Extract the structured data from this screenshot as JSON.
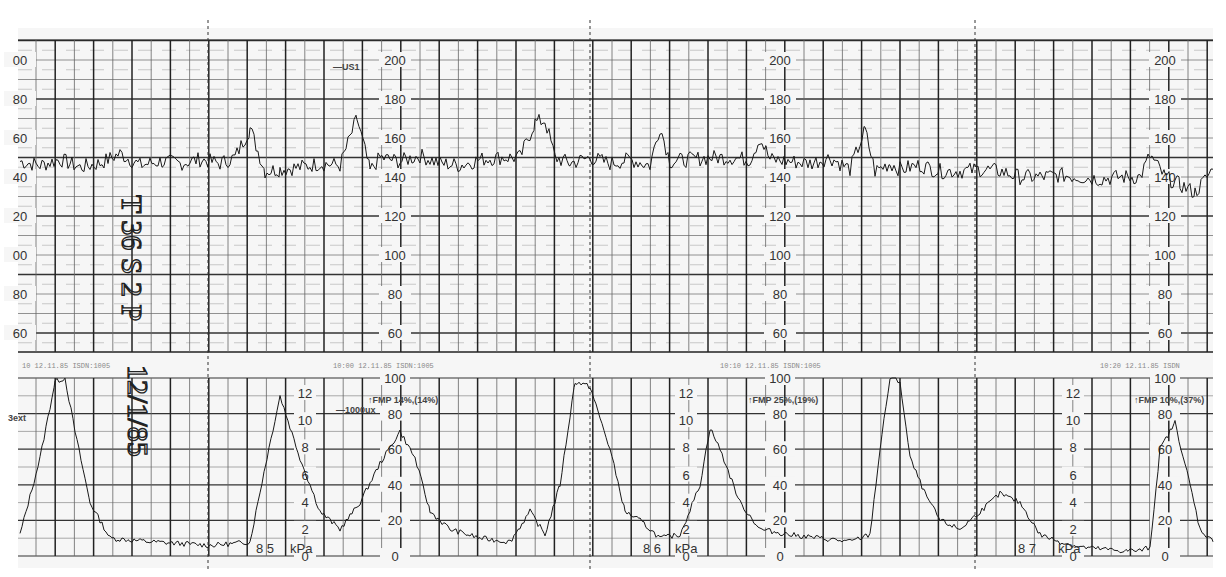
{
  "chart_data": {
    "type": "line",
    "panels": [
      {
        "name": "fetal_heart_rate",
        "ylabel": "bpm",
        "ylim": [
          50,
          210
        ],
        "yticks": [
          60,
          80,
          100,
          120,
          140,
          160,
          180,
          200
        ],
        "scale_label_x_positions": [
          20,
          395,
          780,
          1165
        ],
        "trace_label": "US1",
        "grid": true,
        "series": [
          {
            "name": "FHR",
            "baseline_bpm": 145,
            "x": [
              20,
              40,
              60,
              80,
              100,
              120,
              140,
              160,
              180,
              200,
              220,
              235,
              250,
              265,
              280,
              300,
              320,
              340,
              357,
              370,
              380,
              400,
              420,
              440,
              460,
              480,
              500,
              520,
              535,
              545,
              555,
              570,
              590,
              610,
              630,
              650,
              660,
              670,
              690,
              710,
              730,
              750,
              760,
              770,
              790,
              810,
              830,
              850,
              865,
              875,
              890,
              900,
              920,
              940,
              960,
              980,
              1000,
              1020,
              1040,
              1060,
              1080,
              1100,
              1120,
              1140,
              1150,
              1165,
              1180,
              1195,
              1213
            ],
            "values": [
              148,
              146,
              149,
              145,
              147,
              152,
              146,
              148,
              147,
              149,
              147,
              150,
              165,
              143,
              144,
              145,
              147,
              146,
              170,
              143,
              150,
              148,
              151,
              147,
              146,
              149,
              150,
              150,
              168,
              169,
              150,
              147,
              150,
              147,
              149,
              146,
              166,
              148,
              149,
              150,
              150,
              149,
              160,
              149,
              148,
              147,
              150,
              144,
              164,
              143,
              147,
              144,
              146,
              143,
              143,
              144,
              143,
              140,
              140,
              141,
              140,
              139,
              140,
              140,
              151,
              140,
              136,
              132,
              144
            ]
          },
          {
            "name": "FMP_markers_text",
            "values": []
          }
        ]
      },
      {
        "name": "uterine_activity",
        "ylabel_left": "kPa",
        "ylabel_right": "%",
        "ylim_percent": [
          0,
          100
        ],
        "ylim_kPa": [
          0,
          12
        ],
        "yticks_kPa": [
          0,
          2,
          4,
          6,
          8,
          10,
          12
        ],
        "yticks_percent": [
          0,
          20,
          40,
          60,
          80,
          100
        ],
        "grid": true,
        "series": [
          {
            "name": "UA (TOCO)",
            "x": [
              20,
              40,
              55,
              65,
              75,
              90,
              110,
              130,
              150,
              180,
              210,
              235,
              250,
              265,
              280,
              300,
              320,
              340,
              360,
              380,
              400,
              415,
              430,
              450,
              480,
              510,
              530,
              545,
              560,
              575,
              590,
              610,
              625,
              640,
              660,
              680,
              700,
              710,
              720,
              740,
              760,
              790,
              820,
              850,
              870,
              880,
              890,
              900,
              910,
              925,
              940,
              960,
              980,
              1000,
              1020,
              1040,
              1060,
              1080,
              1100,
              1120,
              1140,
              1150,
              1160,
              1175,
              1190,
              1200,
              1213
            ],
            "values": [
              12,
              55,
              98,
              100,
              70,
              30,
              10,
              9,
              8,
              7,
              6,
              7,
              8,
              50,
              90,
              55,
              25,
              15,
              30,
              52,
              70,
              55,
              25,
              15,
              10,
              8,
              25,
              12,
              40,
              98,
              95,
              60,
              25,
              20,
              10,
              12,
              40,
              72,
              60,
              30,
              15,
              12,
              10,
              8,
              12,
              60,
              100,
              98,
              55,
              35,
              20,
              15,
              25,
              35,
              30,
              12,
              8,
              5,
              4,
              3,
              3,
              5,
              60,
              75,
              40,
              15,
              8
            ]
          }
        ],
        "annotations": [
          {
            "text": "3ext",
            "x": 12,
            "y": 418
          },
          {
            "text": "—1000ux",
            "x": 337,
            "y": 410
          },
          {
            "text": "↑FMP 14%,(14%)",
            "x": 368,
            "y": 400
          },
          {
            "text": "↑FMP 25%,(19%)",
            "x": 748,
            "y": 400
          },
          {
            "text": "↑FMP 10%,(37%)",
            "x": 1134,
            "y": 400
          }
        ]
      }
    ],
    "page_markers": [
      "8 5",
      "8 6",
      "8 7"
    ],
    "unit_label": "kPa",
    "handwriting": [
      "T 36 S 2 P",
      "12/1/85"
    ],
    "trace_label_top": "—US1"
  },
  "labels": {
    "fhr_ticks": [
      "200",
      "180",
      "160",
      "140",
      "120",
      "100",
      "80",
      "60"
    ],
    "ua_pct_ticks": [
      "100",
      "80",
      "60",
      "40",
      "20",
      "0"
    ],
    "ua_kpa_ticks": [
      "12",
      "10",
      "8",
      "6",
      "4",
      "2",
      "0"
    ],
    "page_85": "8 5",
    "page_86": "8 6",
    "page_87": "8 7",
    "kpa": "kPa",
    "us1": "—US1",
    "ext": "3ext",
    "lux": "—1000ux",
    "fmp1": "↑FMP 14%,(14%)",
    "fmp2": "↑FMP 25%,(19%)",
    "fmp3": "↑FMP 10%,(37%)",
    "hand1": "T 36 S 2 P",
    "hand2": "12/1/85"
  },
  "colors": {
    "paper": "#f7f7f7",
    "grid_major": "#222222",
    "grid_minor": "#555555",
    "trace": "#1a1a1a"
  }
}
